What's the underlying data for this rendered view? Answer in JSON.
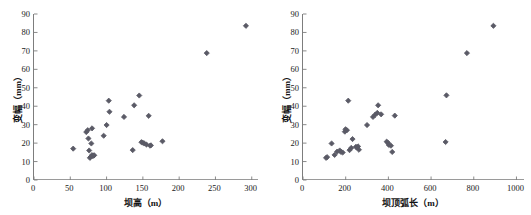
{
  "figure": {
    "background": "#ffffff",
    "marker_color": "#5a5a66",
    "axis_color": "#7d7d7d"
  },
  "chart_data": [
    {
      "type": "scatter",
      "panel": "left",
      "title": "",
      "xlabel": "坝高（m）",
      "ylabel": "变幅（mm）",
      "xlim": [
        0,
        310
      ],
      "ylim": [
        0,
        90
      ],
      "xticks": [
        0,
        50,
        100,
        150,
        200,
        250,
        300
      ],
      "yticks": [
        0,
        10,
        20,
        30,
        40,
        50,
        60,
        70,
        80,
        90
      ],
      "xtick_labels": [
        "0",
        "50",
        "100",
        "150",
        "200",
        "250",
        "300"
      ],
      "ytick_labels": [
        "0",
        "10",
        "20",
        "30",
        "40",
        "50",
        "60",
        "70",
        "80",
        "90"
      ],
      "grid": false,
      "legend": null,
      "marker": "diamond",
      "x": [
        54,
        72,
        74,
        75,
        76,
        77,
        78,
        79,
        80,
        80,
        81,
        82,
        83,
        96,
        100,
        103,
        104,
        124,
        136,
        138,
        145,
        148,
        150,
        152,
        155,
        158,
        160,
        161,
        177,
        238,
        292
      ],
      "y": [
        17.0,
        26.0,
        27.0,
        22.5,
        16.0,
        12.0,
        12.5,
        19.8,
        28.0,
        13.5,
        13.0,
        13.2,
        13.4,
        24.0,
        29.8,
        43.0,
        37.0,
        34.2,
        16.2,
        40.5,
        45.8,
        20.5,
        20.2,
        19.8,
        19.2,
        34.8,
        18.6,
        18.8,
        21.0,
        68.8,
        83.6
      ]
    },
    {
      "type": "scatter",
      "panel": "right",
      "title": "",
      "xlabel": "坝顶弧长（m）",
      "ylabel": "变幅（mm）",
      "xlim": [
        0,
        1040
      ],
      "ylim": [
        0,
        90
      ],
      "xticks": [
        0,
        200,
        400,
        600,
        800,
        1000
      ],
      "yticks": [
        0,
        10,
        20,
        30,
        40,
        50,
        60,
        70,
        80,
        90
      ],
      "xtick_labels": [
        "0",
        "200",
        "400",
        "600",
        "800",
        "1000"
      ],
      "ytick_labels": [
        "0",
        "10",
        "20",
        "30",
        "40",
        "50",
        "60",
        "70",
        "80",
        "90"
      ],
      "grid": false,
      "legend": null,
      "marker": "diamond",
      "x": [
        108,
        113,
        134,
        148,
        160,
        172,
        178,
        186,
        196,
        199,
        206,
        212,
        218,
        226,
        232,
        248,
        252,
        258,
        262,
        300,
        328,
        338,
        348,
        352,
        366,
        392,
        398,
        402,
        412,
        418,
        430,
        668,
        672,
        768,
        892
      ],
      "y": [
        12.0,
        12.4,
        19.8,
        13.6,
        15.4,
        16.0,
        15.2,
        14.9,
        26.2,
        27.5,
        27.0,
        43.0,
        16.2,
        17.4,
        22.2,
        18.0,
        17.6,
        18.2,
        16.4,
        29.8,
        34.2,
        35.4,
        36.4,
        40.5,
        35.6,
        20.8,
        20.2,
        19.0,
        18.6,
        15.2,
        34.9,
        20.6,
        45.9,
        68.8,
        83.6
      ]
    }
  ]
}
